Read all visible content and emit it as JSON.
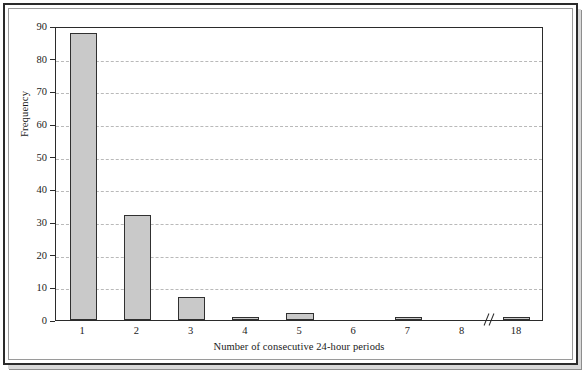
{
  "chart_data": {
    "type": "bar",
    "title": "",
    "subtitle": "",
    "xlabel": "Number of consecutive 24-hour periods",
    "ylabel": "Frequency",
    "categories": [
      "1",
      "2",
      "3",
      "4",
      "5",
      "6",
      "7",
      "8",
      "18"
    ],
    "values": [
      88,
      32,
      7,
      1,
      2,
      0,
      1,
      0,
      1
    ],
    "series": [
      {
        "name": "Frequency",
        "values": [
          88,
          32,
          7,
          1,
          2,
          0,
          1,
          0,
          1
        ]
      }
    ],
    "ylim": [
      0,
      90
    ],
    "y_ticks": [
      0,
      10,
      20,
      30,
      40,
      50,
      60,
      70,
      80,
      90
    ],
    "y_tick_labels": [
      "0",
      "10",
      "20",
      "30",
      "40",
      "50",
      "60",
      "70",
      "80",
      "90"
    ],
    "x_tick_labels": [
      "1",
      "2",
      "3",
      "4",
      "5",
      "6",
      "7",
      "8",
      "18"
    ],
    "grid": "horizontal-dashed",
    "legend": "none",
    "axis_break": {
      "present": true,
      "between": [
        "8",
        "18"
      ],
      "symbol": "//"
    },
    "colors": {
      "bar_fill": "#c9c9c9",
      "bar_edge": "#303030",
      "gridline": "#b9b9b9",
      "axis": "#2b2b2b",
      "text": "#1a1a1a",
      "background": "#ffffff",
      "frame": "#2b2b2b"
    }
  }
}
